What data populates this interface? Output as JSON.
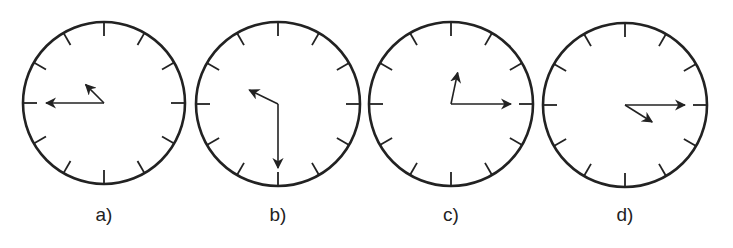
{
  "figure": {
    "stroke_color": "#222222",
    "background": "#ffffff",
    "clocks": [
      {
        "label": "a)",
        "cx": 104,
        "cy": 103,
        "r": 81,
        "minute_hand_angle": 270,
        "hour_hand_angle": 315,
        "minute_len": 58,
        "hour_len": 26,
        "time_shown": "approx 10:45"
      },
      {
        "label": "b)",
        "cx": 278,
        "cy": 104,
        "r": 82,
        "minute_hand_angle": 180,
        "hour_hand_angle": 296,
        "minute_len": 64,
        "hour_len": 32,
        "time_shown": "approx 10:30"
      },
      {
        "label": "c)",
        "cx": 451,
        "cy": 104,
        "r": 82,
        "minute_hand_angle": 90,
        "hour_hand_angle": 12,
        "minute_len": 60,
        "hour_len": 32,
        "time_shown": "approx 12:15"
      },
      {
        "label": "d)",
        "cx": 625,
        "cy": 105,
        "r": 82,
        "minute_hand_angle": 90,
        "hour_hand_angle": 122,
        "minute_len": 60,
        "hour_len": 32,
        "time_shown": "approx 4:15"
      }
    ]
  }
}
